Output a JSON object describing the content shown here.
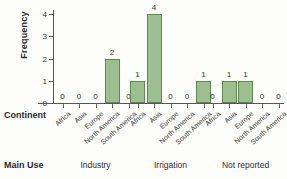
{
  "chart_data": {
    "type": "bar",
    "title": "",
    "xlabel": "Continent",
    "ylabel": "Frequency",
    "ylim": [
      0,
      4
    ],
    "yticks": [
      0,
      1,
      2,
      3,
      4
    ],
    "grid": false,
    "legend": false,
    "grouping_label": "Main Use",
    "categories": [
      "Africa",
      "Asia",
      "Europe",
      "North America",
      "South America"
    ],
    "groups": [
      {
        "name": "Industry",
        "values": [
          0,
          0,
          0,
          2,
          0
        ]
      },
      {
        "name": "Irrigation",
        "values": [
          1,
          4,
          0,
          0,
          1
        ]
      },
      {
        "name": "Not reported",
        "values": [
          0,
          1,
          1,
          0,
          0
        ]
      }
    ],
    "bar_labels": [
      [
        "0",
        "0",
        "0",
        "2",
        "0"
      ],
      [
        "1",
        "4",
        "0",
        "0",
        "1"
      ],
      [
        "0",
        "1",
        "1",
        "0",
        "0"
      ]
    ],
    "colors": {
      "bar_fill": "#9dbf90",
      "bar_border": "#5f8a52",
      "axis": "#555555",
      "text": "#2a2a2a",
      "background": "#fdfdfb"
    }
  },
  "axis": {
    "y_label": "Frequency",
    "y_ticks": [
      "0",
      "1",
      "2",
      "3",
      "4"
    ]
  },
  "rows": {
    "continent_header": "Continent",
    "main_use_header": "Main Use"
  }
}
